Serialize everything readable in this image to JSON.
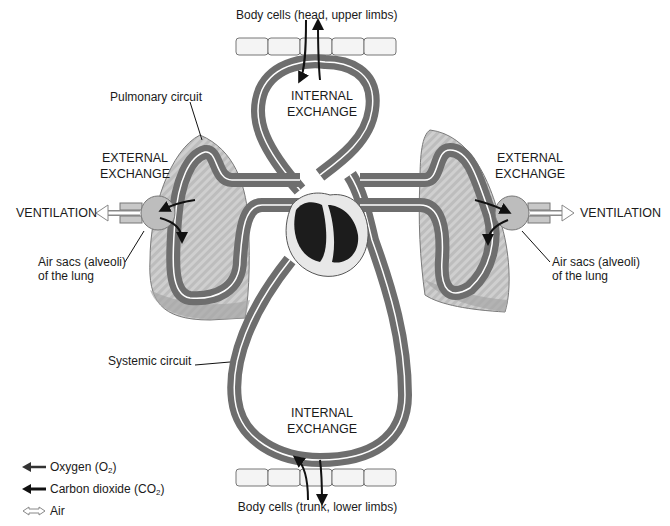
{
  "labels": {
    "top_cells": "Body cells (head, upper limbs)",
    "bottom_cells": "Body cells (trunk, lower limbs)",
    "internal_exchange_top": [
      "INTERNAL",
      "EXCHANGE"
    ],
    "internal_exchange_bottom": [
      "INTERNAL",
      "EXCHANGE"
    ],
    "external_exchange_left": [
      "EXTERNAL",
      "EXCHANGE"
    ],
    "external_exchange_right": [
      "EXTERNAL",
      "EXCHANGE"
    ],
    "ventilation_left": "VENTILATION",
    "ventilation_right": "VENTILATION",
    "pulmonary_circuit": "Pulmonary circuit",
    "systemic_circuit": "Systemic circuit",
    "air_sacs_left": [
      "Air sacs (alveoli)",
      "of the lung"
    ],
    "air_sacs_right": [
      "Air sacs (alveoli)",
      "of the lung"
    ]
  },
  "legend": {
    "items": [
      {
        "icon": "oxygen-arrow-icon",
        "label": "Oxygen (O",
        "sub": "2",
        "tail": ")"
      },
      {
        "icon": "co2-arrow-icon",
        "label": "Carbon dioxide (CO",
        "sub": "2",
        "tail": ")"
      },
      {
        "icon": "air-arrow-icon",
        "label": "Air",
        "sub": "",
        "tail": ""
      }
    ]
  },
  "colors": {
    "vessel": "#6e6e6e",
    "vessel_dark": "#4a4a4a",
    "lung_fill": "#c8c8c8",
    "lung_stroke": "#7a7a7a",
    "heart_dark": "#1c1c1c",
    "heart_light": "#e8e8e8",
    "arrow": "#111111",
    "cell_fill": "#f4f4f4",
    "cell_stroke": "#777777"
  }
}
